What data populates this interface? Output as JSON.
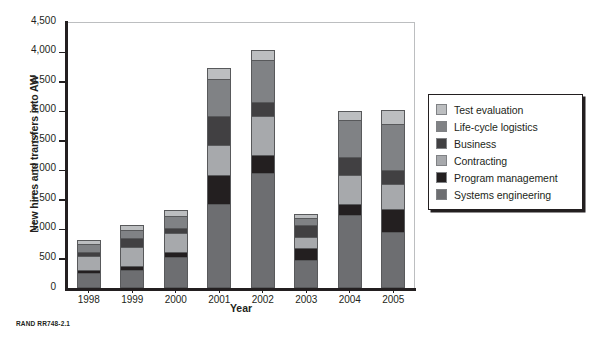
{
  "figure": {
    "source_note": "RAND RR748-2.1"
  },
  "chart_data": {
    "type": "bar",
    "stacked": true,
    "title": "",
    "xlabel": "Year",
    "ylabel": "New hires and transfers into AW",
    "categories": [
      "1998",
      "1999",
      "2000",
      "2001",
      "2002",
      "2003",
      "2004",
      "2005"
    ],
    "ylim": [
      0,
      4500
    ],
    "yticks": [
      0,
      500,
      1000,
      1500,
      2000,
      2500,
      3000,
      3500,
      4000,
      4500
    ],
    "ytick_labels": [
      "0",
      "500",
      "1,000",
      "1,500",
      "2,000",
      "2,500",
      "3,000",
      "3,500",
      "4,000",
      "4,500"
    ],
    "grid": false,
    "legend_position": "right",
    "stack_order_bottom_to_top": [
      "Systems engineering",
      "Program management",
      "Contracting",
      "Business",
      "Life-cycle logistics",
      "Test evaluation"
    ],
    "series": [
      {
        "name": "Systems engineering",
        "color": "#6d6e71",
        "values": [
          250,
          310,
          530,
          1420,
          1950,
          480,
          1230,
          950
        ]
      },
      {
        "name": "Program management",
        "color": "#231f20",
        "values": [
          60,
          70,
          80,
          500,
          300,
          200,
          190,
          380
        ]
      },
      {
        "name": "Contracting",
        "color": "#a7a9ac",
        "values": [
          230,
          310,
          320,
          500,
          660,
          180,
          490,
          430
        ]
      },
      {
        "name": "Business",
        "color": "#414042",
        "values": [
          70,
          150,
          90,
          490,
          230,
          210,
          310,
          240
        ]
      },
      {
        "name": "Life-cycle logistics",
        "color": "#808285",
        "values": [
          140,
          140,
          200,
          620,
          710,
          110,
          630,
          780
        ]
      },
      {
        "name": "Test evaluation",
        "color": "#bcbec0",
        "values": [
          60,
          90,
          100,
          190,
          180,
          70,
          150,
          230
        ]
      }
    ],
    "totals": [
      810,
      1070,
      1320,
      3720,
      4030,
      1250,
      3000,
      3010
    ]
  },
  "legend": {
    "items": [
      {
        "label": "Test evaluation",
        "color": "#bcbec0"
      },
      {
        "label": "Life-cycle logistics",
        "color": "#808285"
      },
      {
        "label": "Business",
        "color": "#414042"
      },
      {
        "label": "Contracting",
        "color": "#a7a9ac"
      },
      {
        "label": "Program management",
        "color": "#231f20"
      },
      {
        "label": "Systems engineering",
        "color": "#6d6e71"
      }
    ]
  }
}
